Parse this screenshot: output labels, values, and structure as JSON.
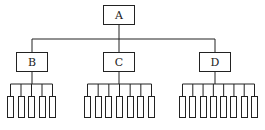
{
  "diagram": {
    "type": "tree",
    "root": {
      "label": "A"
    },
    "children": [
      {
        "label": "B",
        "leaf_count": 5
      },
      {
        "label": "C",
        "leaf_count": 7
      },
      {
        "label": "D",
        "leaf_count": 8
      }
    ],
    "colors": {
      "line": "#222222",
      "background": "#ffffff"
    }
  },
  "layout": {
    "root": {
      "x": 103,
      "y": 5,
      "w": 32,
      "h": 20
    },
    "root_bus_y": 39,
    "children": [
      {
        "x": 16,
        "y": 52,
        "w": 32,
        "h": 20,
        "bus_y": 84,
        "leaf_x0": 7,
        "leaf_x1": 56
      },
      {
        "x": 103,
        "y": 52,
        "w": 32,
        "h": 20,
        "bus_y": 84,
        "leaf_x0": 84,
        "leaf_x1": 155
      },
      {
        "x": 199,
        "y": 52,
        "w": 32,
        "h": 20,
        "bus_y": 84,
        "leaf_x0": 179,
        "leaf_x1": 258
      }
    ],
    "leaf": {
      "y": 96,
      "w": 7,
      "h": 22
    }
  }
}
